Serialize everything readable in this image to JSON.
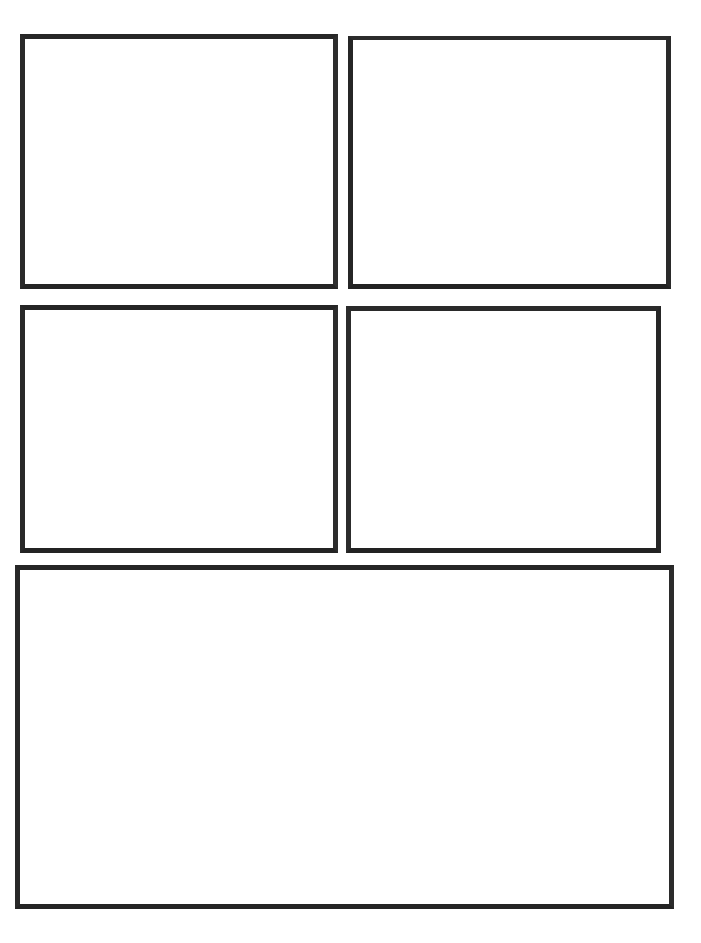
{
  "page": {
    "background_color": "#ffffff",
    "width": 701,
    "height": 943,
    "title": "",
    "header_text": "",
    "footer_text": ""
  },
  "style": {
    "panel_border_color": "#2b2b2b",
    "panel_fill_color": "#ffffff",
    "panel_border_width_px": 5
  },
  "panels": [
    {
      "id": "panel-1",
      "label": "",
      "caption": "",
      "content": "",
      "row": 1,
      "column": 1
    },
    {
      "id": "panel-2",
      "label": "",
      "caption": "",
      "content": "",
      "row": 1,
      "column": 2
    },
    {
      "id": "panel-3",
      "label": "",
      "caption": "",
      "content": "",
      "row": 2,
      "column": 1
    },
    {
      "id": "panel-4",
      "label": "",
      "caption": "",
      "content": "",
      "row": 2,
      "column": 2
    },
    {
      "id": "panel-5",
      "label": "",
      "caption": "",
      "content": "",
      "row": 3,
      "column": 1
    }
  ]
}
